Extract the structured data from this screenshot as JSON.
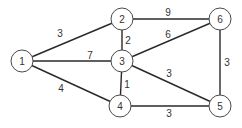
{
  "graph": {
    "nodes": [
      {
        "id": "1",
        "label": "1",
        "x": 22,
        "y": 61
      },
      {
        "id": "2",
        "label": "2",
        "x": 122,
        "y": 19
      },
      {
        "id": "3",
        "label": "3",
        "x": 122,
        "y": 61
      },
      {
        "id": "4",
        "label": "4",
        "x": 120,
        "y": 106
      },
      {
        "id": "5",
        "label": "5",
        "x": 220,
        "y": 106
      },
      {
        "id": "6",
        "label": "6",
        "x": 220,
        "y": 19
      }
    ],
    "edges": [
      {
        "from": "1",
        "to": "2",
        "weight": "3",
        "lx": 60,
        "ly": 33
      },
      {
        "from": "1",
        "to": "3",
        "weight": "7",
        "lx": 90,
        "ly": 55
      },
      {
        "from": "1",
        "to": "4",
        "weight": "4",
        "lx": 61,
        "ly": 88
      },
      {
        "from": "2",
        "to": "3",
        "weight": "2",
        "lx": 128,
        "ly": 40
      },
      {
        "from": "2",
        "to": "6",
        "weight": "9",
        "lx": 168,
        "ly": 12
      },
      {
        "from": "3",
        "to": "6",
        "weight": "6",
        "lx": 168,
        "ly": 34
      },
      {
        "from": "3",
        "to": "4",
        "weight": "1",
        "lx": 127,
        "ly": 84
      },
      {
        "from": "3",
        "to": "5",
        "weight": "3",
        "lx": 169,
        "ly": 73
      },
      {
        "from": "4",
        "to": "5",
        "weight": "3",
        "lx": 169,
        "ly": 113
      },
      {
        "from": "6",
        "to": "5",
        "weight": "3",
        "lx": 227,
        "ly": 62
      }
    ],
    "node_radius": 11
  }
}
